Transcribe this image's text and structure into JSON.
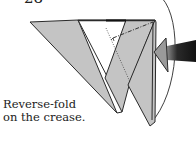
{
  "step": {
    "number": "28"
  },
  "caption": {
    "line1": "Reverse-fold",
    "line2": "on the crease."
  },
  "diagram": {
    "arrow": "push-arrow-from-right",
    "colors": {
      "paper": "#c4c4c4",
      "outline": "#2a2a2a",
      "background": "#ffffff",
      "arrow_dark": "#1a1a1a"
    }
  }
}
